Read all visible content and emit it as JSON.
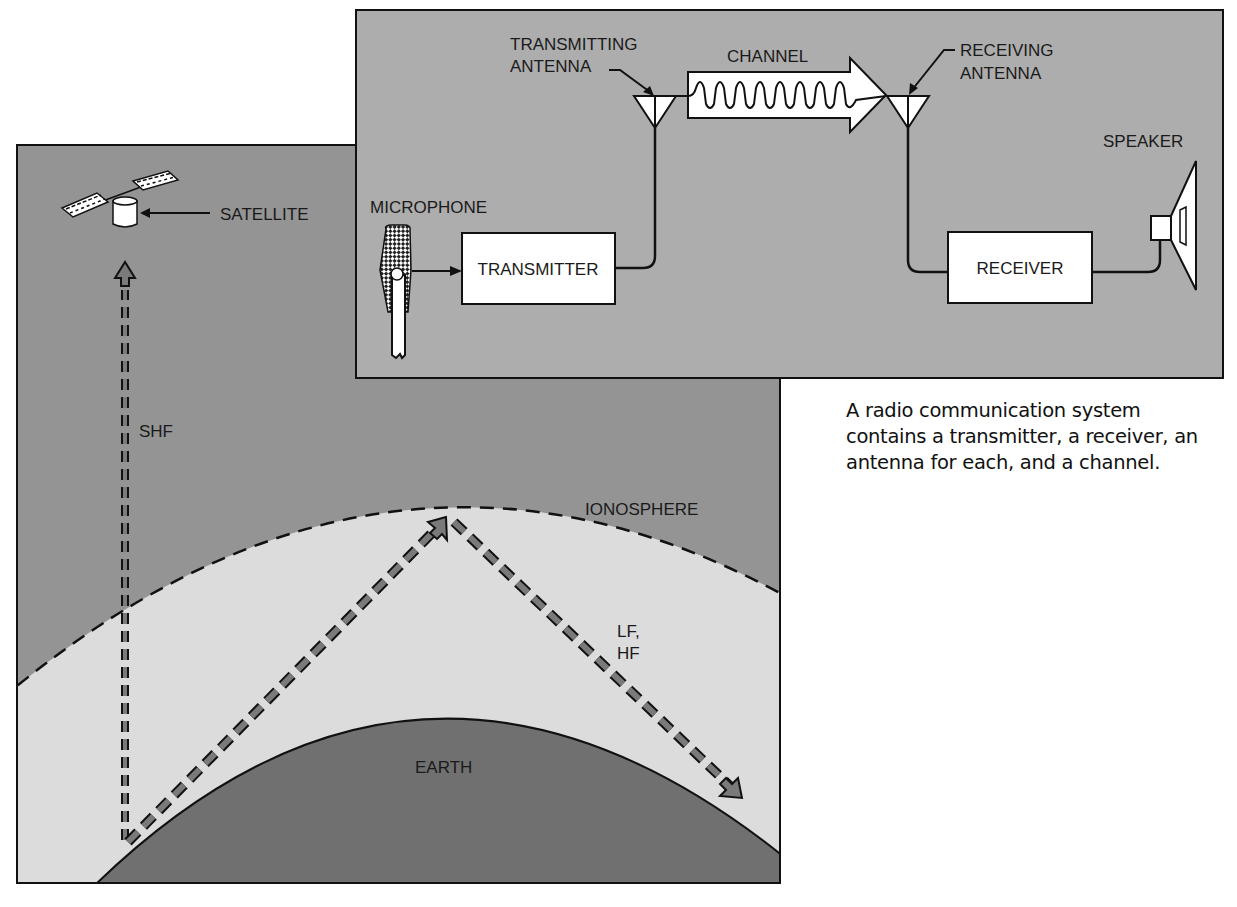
{
  "propagation_panel": {
    "satellite_label": "SATELLITE",
    "shf_label": "SHF",
    "ionosphere_label": "IONOSPHERE",
    "lf_hf_label_line1": "LF,",
    "lf_hf_label_line2": "HF",
    "earth_label": "EARTH",
    "colors": {
      "space": "#949494",
      "atmosphere": "#dcdcdc",
      "earth": "#707070",
      "path_fill": "#7a7a7a"
    }
  },
  "system_panel": {
    "transmitting_antenna_line1": "TRANSMITTING",
    "transmitting_antenna_line2": "ANTENNA",
    "channel_label": "CHANNEL",
    "receiving_antenna_line1": "RECEIVING",
    "receiving_antenna_line2": "ANTENNA",
    "speaker_label": "SPEAKER",
    "microphone_label": "MICROPHONE",
    "transmitter_label": "TRANSMITTER",
    "receiver_label": "RECEIVER",
    "colors": {
      "background": "#adadad",
      "box": "#ffffff",
      "line": "#111111"
    }
  },
  "caption": {
    "text": "A radio communication system contains a transmitter, a receiver, an antenna for each, and a channel."
  }
}
